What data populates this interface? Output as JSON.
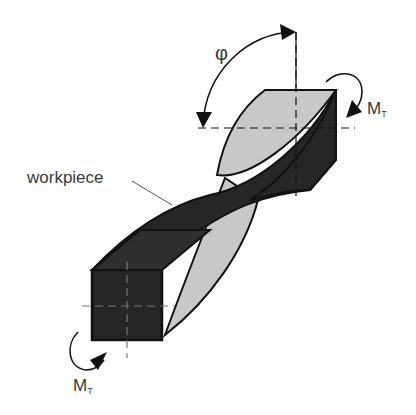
{
  "diagram": {
    "labels": {
      "workpiece": "workpiece",
      "angle": "φ",
      "torque_top_main": "M",
      "torque_top_sub": "T",
      "torque_bottom_main": "M",
      "torque_bottom_sub": "T"
    },
    "colors": {
      "dark_face": "#262626",
      "light_face": "#c8c8c8",
      "outline": "#111111",
      "text": "#3a3a3a"
    }
  }
}
